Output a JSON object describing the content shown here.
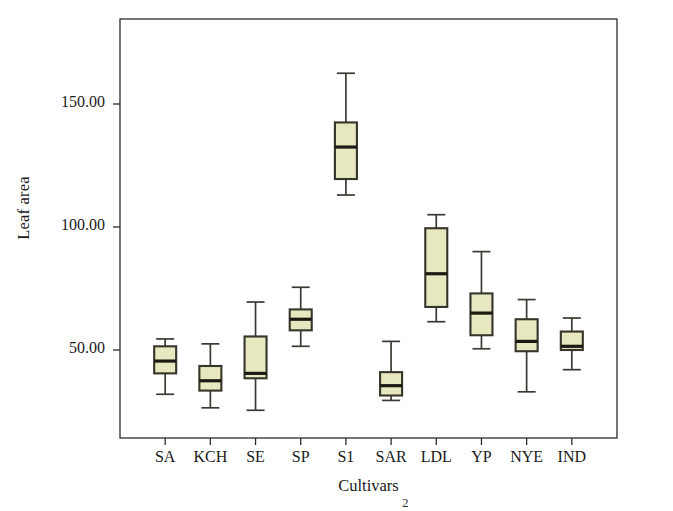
{
  "chart_data": {
    "type": "box",
    "title": "",
    "xlabel": "Cultivars",
    "ylabel": "Leaf area",
    "categories": [
      "SA",
      "KCH",
      "SE",
      "SP",
      "S1",
      "SAR",
      "LDL",
      "YP",
      "NYE",
      "IND"
    ],
    "ytick_labels": [
      "50.00",
      "100.00",
      "150.00"
    ],
    "ytick_values": [
      50,
      100,
      150
    ],
    "ylim": [
      22,
      182
    ],
    "xlim": [
      0,
      11
    ],
    "grid": false,
    "legend": null,
    "box_fill_color": "#e7e7c0",
    "box_edge_color": "#35352a",
    "median_color": "#1b1b14",
    "whisker_color": "#3a3a32",
    "frame_color": "#2b2b2b",
    "boxes": [
      {
        "category": "SA",
        "whisker_low": 32.0,
        "q1": 40.5,
        "median": 45.5,
        "q3": 51.5,
        "whisker_high": 54.5
      },
      {
        "category": "KCH",
        "whisker_low": 26.5,
        "q1": 33.5,
        "median": 37.5,
        "q3": 43.5,
        "whisker_high": 52.5
      },
      {
        "category": "SE",
        "whisker_low": 25.5,
        "q1": 38.5,
        "median": 40.5,
        "q3": 55.5,
        "whisker_high": 69.5
      },
      {
        "category": "SP",
        "whisker_low": 51.5,
        "q1": 58.0,
        "median": 62.5,
        "q3": 66.5,
        "whisker_high": 75.5
      },
      {
        "category": "S1",
        "whisker_low": 113.0,
        "q1": 119.5,
        "median": 132.5,
        "q3": 142.5,
        "whisker_high": 162.5
      },
      {
        "category": "SAR",
        "whisker_low": 29.5,
        "q1": 31.5,
        "median": 35.5,
        "q3": 41.0,
        "whisker_high": 53.5
      },
      {
        "category": "LDL",
        "whisker_low": 61.5,
        "q1": 67.5,
        "median": 81.0,
        "q3": 99.5,
        "whisker_high": 105.0
      },
      {
        "category": "YP",
        "whisker_low": 50.5,
        "q1": 56.0,
        "median": 65.0,
        "q3": 73.0,
        "whisker_high": 90.0
      },
      {
        "category": "NYE",
        "whisker_low": 33.0,
        "q1": 49.5,
        "median": 53.5,
        "q3": 62.5,
        "whisker_high": 70.5
      },
      {
        "category": "IND",
        "whisker_low": 42.0,
        "q1": 50.0,
        "median": 51.5,
        "q3": 57.5,
        "whisker_high": 63.0
      }
    ],
    "annotations": [
      {
        "id": "figure-footnote-marker",
        "text": "2"
      }
    ]
  }
}
